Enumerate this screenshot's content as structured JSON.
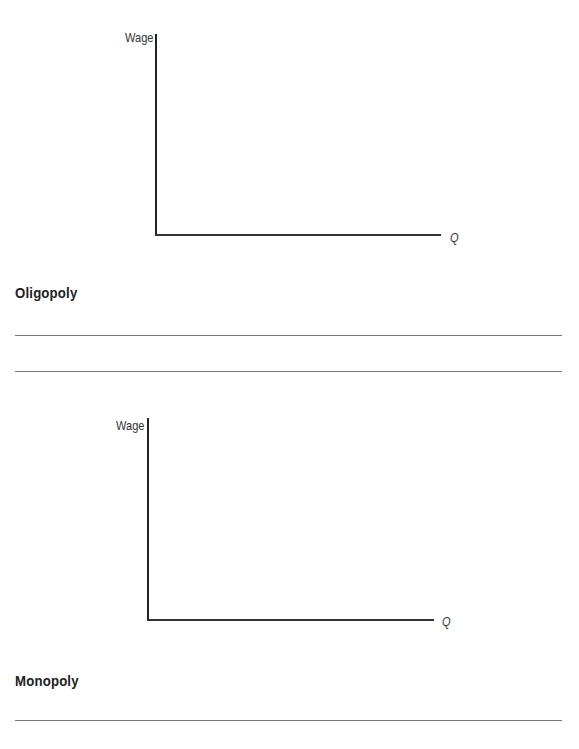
{
  "graphs": [
    {
      "y_axis_label": "Wage",
      "x_axis_label": "Q",
      "section_title": "Oligopoly",
      "answer_lines": 2
    },
    {
      "y_axis_label": "Wage",
      "x_axis_label": "Q",
      "section_title": "Monopoly",
      "answer_lines": 1
    }
  ],
  "colors": {
    "axis": "#222222",
    "answer_line": "#777777",
    "text": "#222222"
  }
}
